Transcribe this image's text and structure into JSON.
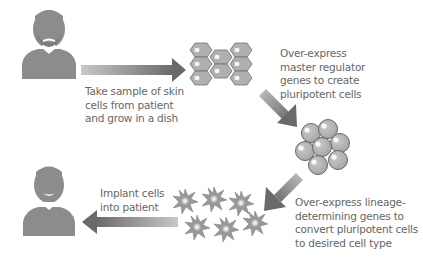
{
  "steps": [
    {
      "id": "sample",
      "lines": [
        "Take sample of skin",
        "cells from patient",
        "and grow in a dish"
      ]
    },
    {
      "id": "reprogram",
      "lines": [
        "Over-express",
        "master regulator",
        "genes to create",
        "pluripotent cells"
      ]
    },
    {
      "id": "differentiate",
      "lines": [
        "Over-express lineage-",
        "determining genes to",
        "convert pluripotent cells",
        "to desired cell type"
      ]
    },
    {
      "id": "implant",
      "lines": [
        "Implant cells",
        "into patient"
      ]
    }
  ],
  "icons": {
    "patient_before": "person-neutral-icon",
    "skin_cells": "hexagon-cell-cluster-icon",
    "pluripotent_cells": "round-cell-cluster-icon",
    "differentiated_cells": "spiky-cell-icon",
    "patient_after": "person-smiling-icon"
  },
  "colors": {
    "figure_gray": "#8c8c8c",
    "cell_fill": "#b3b3b3",
    "cell_stroke": "#707070",
    "arrow_dark": "#6e6e6e",
    "arrow_light": "#c4c4c4",
    "text": "#666666"
  }
}
